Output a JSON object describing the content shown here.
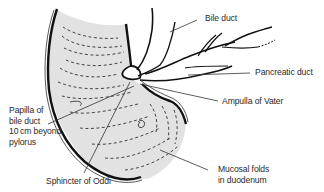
{
  "diagram": {
    "colors": {
      "duodenum_fill": "#e2e2e2",
      "outline": "#111111",
      "leader_line": "#333333",
      "label_text": "#2a2a2a",
      "background": "#ffffff"
    },
    "labels": {
      "bile_duct": "Bile duct",
      "pancreatic_duct": "Pancreatic duct",
      "ampulla": "Ampulla of Vater",
      "papilla_line1": "Papilla of",
      "papilla_line2": "bile duct",
      "papilla_line3": "10 cm beyond",
      "papilla_line4": "pylorus",
      "sphincter": "Sphincter of Oddi",
      "mucosal_line1": "Mucosal folds",
      "mucosal_line2": "in duodenum"
    }
  }
}
